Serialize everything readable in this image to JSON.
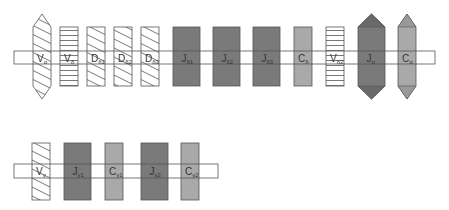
{
  "colors": {
    "stroke": "#555555",
    "dark_gray": "#7a7a7a",
    "light_gray": "#a9a9a9",
    "bar_fill": "none",
    "background": "#ffffff"
  },
  "rows": [
    {
      "name": "alpha-delta-locus",
      "bar": {
        "x": 14,
        "y": 51,
        "width": 421,
        "height": 13
      },
      "segments": [
        {
          "id": "V-alpha",
          "main": "V",
          "sub": "α",
          "shape": "hexagon",
          "pattern": "diagonal",
          "x": 33,
          "w": 18
        },
        {
          "id": "V-delta",
          "main": "V",
          "sub": "δ",
          "shape": "rect",
          "pattern": "horizontal",
          "x": 60,
          "w": 18
        },
        {
          "id": "D-delta1",
          "main": "D",
          "sub": "δ1",
          "shape": "rect",
          "pattern": "diagonal",
          "x": 87,
          "w": 18
        },
        {
          "id": "D-delta2",
          "main": "D",
          "sub": "δ2",
          "shape": "rect",
          "pattern": "diagonal",
          "x": 114,
          "w": 18
        },
        {
          "id": "D-delta3",
          "main": "D",
          "sub": "δ3",
          "shape": "rect",
          "pattern": "diagonal",
          "x": 141,
          "w": 18
        },
        {
          "id": "J-delta1",
          "main": "J",
          "sub": "δ1",
          "shape": "rect",
          "pattern": "dark",
          "x": 173,
          "w": 27
        },
        {
          "id": "J-delta2",
          "main": "J",
          "sub": "δ2",
          "shape": "rect",
          "pattern": "dark",
          "x": 213,
          "w": 27
        },
        {
          "id": "J-delta3",
          "main": "J",
          "sub": "δ3",
          "shape": "rect",
          "pattern": "dark",
          "x": 253,
          "w": 27
        },
        {
          "id": "C-delta",
          "main": "C",
          "sub": "δ",
          "shape": "rect",
          "pattern": "light",
          "x": 294,
          "w": 18
        },
        {
          "id": "V-delta2",
          "main": "V",
          "sub": "δ2",
          "shape": "rect",
          "pattern": "horizontal",
          "x": 326,
          "w": 18
        },
        {
          "id": "J-alpha",
          "main": "J",
          "sub": "α",
          "shape": "hexagon",
          "pattern": "dark",
          "x": 358,
          "w": 27
        },
        {
          "id": "C-alpha",
          "main": "C",
          "sub": "α",
          "shape": "hexagon",
          "pattern": "light",
          "x": 398,
          "w": 18
        }
      ],
      "rect_top": 27,
      "rect_bottom": 86,
      "tip_top": 14,
      "tip_bottom": 99
    },
    {
      "name": "gamma-locus",
      "bar": {
        "x": 14,
        "y": 164,
        "width": 204,
        "height": 14
      },
      "segments": [
        {
          "id": "V-gamma",
          "main": "V",
          "sub": "γ",
          "shape": "rect",
          "pattern": "diagonal",
          "x": 32,
          "w": 18
        },
        {
          "id": "J-gamma1",
          "main": "J",
          "sub": "γ1",
          "shape": "rect",
          "pattern": "dark",
          "x": 64,
          "w": 27
        },
        {
          "id": "C-gamma1",
          "main": "C",
          "sub": "γ1",
          "shape": "rect",
          "pattern": "light",
          "x": 105,
          "w": 18
        },
        {
          "id": "J-gamma2",
          "main": "J",
          "sub": "γ2",
          "shape": "rect",
          "pattern": "dark",
          "x": 141,
          "w": 27
        },
        {
          "id": "C-gamma2",
          "main": "C",
          "sub": "γ2",
          "shape": "rect",
          "pattern": "light",
          "x": 181,
          "w": 18
        }
      ],
      "rect_top": 143,
      "rect_bottom": 200
    }
  ]
}
